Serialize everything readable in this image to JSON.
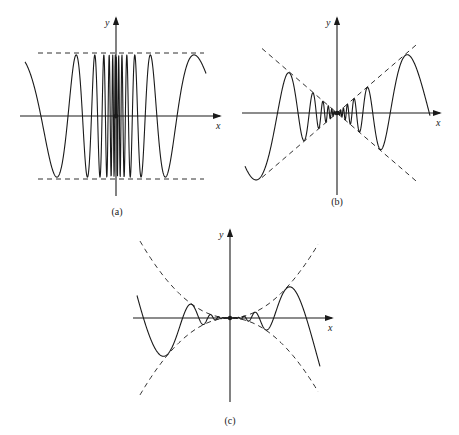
{
  "figure": {
    "background": "#ffffff",
    "ink": "#1a1a1a",
    "panels": [
      {
        "id": "a",
        "caption": "(a)",
        "x_label": "x",
        "y_label": "y",
        "origin": [
          116,
          116
        ],
        "x_axis": [
          20,
          220
        ],
        "y_axis": [
          18,
          196
        ],
        "caption_pos": [
          117,
          215
        ],
        "envelope_type": "constant",
        "envelope_desc": "horizontal dashed lines y = ±A",
        "amplitude_px": 63,
        "envelope_x": [
          38,
          204
        ],
        "curve_desc": "oscillation with frequency increasing toward the origin, bounded by constant envelope",
        "curve_x": [
          25,
          206
        ],
        "origin_dot": true
      },
      {
        "id": "b",
        "caption": "(b)",
        "x_label": "x",
        "y_label": "y",
        "origin": [
          337,
          113
        ],
        "x_axis": [
          242,
          440
        ],
        "y_axis": [
          18,
          195
        ],
        "caption_pos": [
          337,
          205
        ],
        "envelope_type": "linear",
        "envelope_desc": "dashed lines y = ±|x|",
        "slope": 0.86,
        "envelope_x": [
          262,
          418
        ],
        "curve_desc": "oscillation with amplitude decreasing linearly toward origin and frequency increasing, bounded by |x|",
        "curve_x": [
          245,
          430
        ],
        "origin_dot": true
      },
      {
        "id": "c",
        "caption": "(c)",
        "x_label": "x",
        "y_label": "y",
        "origin": [
          230,
          318
        ],
        "x_axis": [
          133,
          332
        ],
        "y_axis": [
          230,
          402
        ],
        "caption_pos": [
          230,
          424
        ],
        "envelope_type": "quadratic",
        "envelope_desc": "dashed parabolas y = ±x²",
        "quad_k": 0.0095,
        "envelope_x": [
          140,
          318
        ],
        "curve_desc": "oscillation with amplitude decreasing quadratically toward origin, bounded by x²",
        "curve_x": [
          137,
          320
        ],
        "origin_dot": true
      }
    ]
  }
}
